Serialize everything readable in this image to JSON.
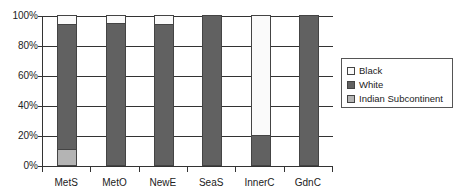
{
  "chart_data": {
    "type": "bar",
    "stacked": true,
    "normalized": true,
    "title": "",
    "xlabel": "",
    "ylabel": "",
    "ylim": [
      0,
      100
    ],
    "yticks": [
      "0%",
      "20%",
      "40%",
      "60%",
      "80%",
      "100%"
    ],
    "grid": true,
    "legend_position": "right",
    "categories": [
      "MetS",
      "MetO",
      "NewE",
      "SeaS",
      "InnerC",
      "GdnC"
    ],
    "series": [
      {
        "name": "Indian Subcontinent",
        "color": "#b4b4b4",
        "values": [
          11,
          0,
          0,
          0,
          0,
          0
        ]
      },
      {
        "name": "White",
        "color": "#616161",
        "values": [
          83,
          95,
          94,
          100,
          20,
          100
        ]
      },
      {
        "name": "Black",
        "color": "#fafafa",
        "values": [
          6,
          5,
          6,
          0,
          80,
          0
        ]
      }
    ],
    "legend": [
      "Black",
      "White",
      "Indian Subcontinent"
    ]
  }
}
